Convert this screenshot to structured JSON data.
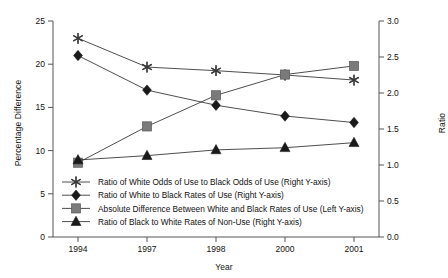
{
  "chart_data": {
    "type": "line",
    "title": "",
    "xlabel": "Year",
    "ylabel": "Percentage Difference",
    "ylabel_right": "Ratio",
    "categories": [
      "1994",
      "1997",
      "1998",
      "2000",
      "2001"
    ],
    "ylim": [
      0,
      25
    ],
    "yticks": [
      "0",
      "5",
      "10",
      "15",
      "20",
      "25"
    ],
    "ylim_right": [
      0,
      3
    ],
    "yticks_right": [
      "0.0",
      "0.5",
      "1.0",
      "1.5",
      "2.0",
      "2.5",
      "3.0"
    ],
    "grid": false,
    "legend_position": "inside-lower-left",
    "series": [
      {
        "name": "Ratio of White Odds of Use to Black Odds of Use (Right Y-axis)",
        "marker": "star",
        "axis": "right",
        "color": "#3a3a3a",
        "values": [
          2.76,
          2.36,
          2.31,
          2.25,
          2.18
        ]
      },
      {
        "name": "Ratio of White to Black Rates of Use (Right Y-axis)",
        "marker": "diamond",
        "axis": "right",
        "color": "#1a1a1a",
        "values": [
          2.52,
          2.04,
          1.83,
          1.68,
          1.59
        ]
      },
      {
        "name": "Absolute Difference Between White and Black Rates of Use (Left Y-axis)",
        "marker": "square",
        "axis": "left",
        "color": "#7a7a7a",
        "values": [
          8.6,
          12.8,
          16.4,
          18.8,
          19.8
        ]
      },
      {
        "name": "Ratio of Black to White Rates of Non-Use (Right Y-axis)",
        "marker": "triangle",
        "axis": "right",
        "color": "#1a1a1a",
        "values": [
          1.07,
          1.13,
          1.21,
          1.24,
          1.31
        ]
      }
    ]
  }
}
